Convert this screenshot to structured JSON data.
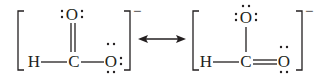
{
  "diagram": {
    "type": "lewis-resonance",
    "ink_color": "#231f20",
    "background": "#ffffff",
    "resonance_arrow": "double-headed",
    "structures": [
      {
        "charge": "−",
        "atoms": {
          "h": "H",
          "c": "C",
          "o_top": "O",
          "o_right": "O"
        },
        "bonds": [
          {
            "from": "H",
            "to": "C",
            "order": 1
          },
          {
            "from": "C",
            "to": "O_top",
            "order": 2
          },
          {
            "from": "C",
            "to": "O_right",
            "order": 1
          }
        ],
        "lone_pairs": {
          "o_top": 2,
          "o_right": 3
        }
      },
      {
        "charge": "−",
        "atoms": {
          "h": "H",
          "c": "C",
          "o_top": "O",
          "o_right": "O"
        },
        "bonds": [
          {
            "from": "H",
            "to": "C",
            "order": 1
          },
          {
            "from": "C",
            "to": "O_top",
            "order": 1
          },
          {
            "from": "C",
            "to": "O_right",
            "order": 2
          }
        ],
        "lone_pairs": {
          "o_top": 3,
          "o_right": 2
        }
      }
    ]
  }
}
